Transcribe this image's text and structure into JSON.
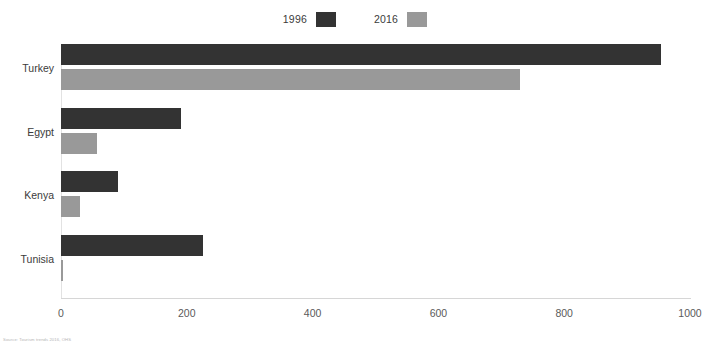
{
  "chart_data": {
    "type": "bar",
    "orientation": "horizontal",
    "title": "",
    "xlabel": "",
    "ylabel": "",
    "xlim": [
      0,
      1000
    ],
    "xticks": [
      0,
      200,
      400,
      600,
      800,
      1000
    ],
    "grid": false,
    "legend_position": "top-center",
    "categories": [
      "Turkey",
      "Egypt",
      "Kenya",
      "Tunisia"
    ],
    "series": [
      {
        "name": "1996",
        "color": "#333333",
        "values": [
          954,
          191,
          90,
          226
        ]
      },
      {
        "name": "2016",
        "color": "#999999",
        "values": [
          730,
          57,
          30,
          3
        ]
      }
    ],
    "annotations": {
      "source": "Source: Tourism trends 2016, OHS"
    }
  },
  "legend": {
    "entries": [
      {
        "label": "1996",
        "swatch": "#333333"
      },
      {
        "label": "2016",
        "swatch": "#999999"
      }
    ]
  },
  "axis": {
    "tick_labels": [
      "0",
      "200",
      "400",
      "600",
      "800",
      "1000"
    ]
  },
  "categories": {
    "labels": [
      "Turkey",
      "Egypt",
      "Kenya",
      "Tunisia"
    ]
  },
  "footer": {
    "source": "Source: Tourism trends 2016, OHS"
  },
  "colors": {
    "series_1996": "#333333",
    "series_2016": "#999999",
    "axis": "#d6d6d6",
    "text": "#3b3b3b"
  }
}
